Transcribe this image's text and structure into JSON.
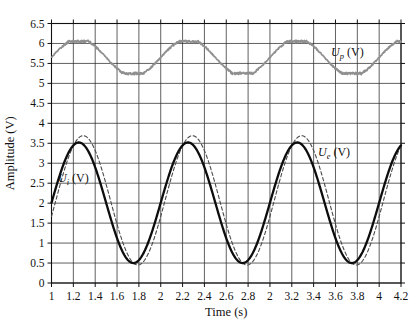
{
  "figure": {
    "background": "#ffffff"
  },
  "chart_data": {
    "type": "line",
    "title": "",
    "xlabel": "Time (s)",
    "ylabel": "Amplitude (V)",
    "xlim": [
      1,
      4.2
    ],
    "ylim": [
      0,
      6.5
    ],
    "grid": true,
    "legend_position": "inline-annotations",
    "x_ticks": [
      {
        "value": 1.0,
        "label": "1"
      },
      {
        "value": 1.2,
        "label": "1.2"
      },
      {
        "value": 1.4,
        "label": "1.4"
      },
      {
        "value": 1.6,
        "label": "1.6"
      },
      {
        "value": 1.8,
        "label": "1.8"
      },
      {
        "value": 2.0,
        "label": "2"
      },
      {
        "value": 2.2,
        "label": "2.2"
      },
      {
        "value": 2.4,
        "label": "2.4"
      },
      {
        "value": 2.6,
        "label": "2.6"
      },
      {
        "value": 2.8,
        "label": "2.8"
      },
      {
        "value": 3.0,
        "label": "2"
      },
      {
        "value": 3.2,
        "label": "3.2"
      },
      {
        "value": 3.4,
        "label": "3.4"
      },
      {
        "value": 3.6,
        "label": "3.6"
      },
      {
        "value": 3.8,
        "label": "3.8"
      },
      {
        "value": 4.0,
        "label": "4"
      },
      {
        "value": 4.2,
        "label": "4.2"
      }
    ],
    "y_ticks": [
      {
        "value": 0,
        "label": "0"
      },
      {
        "value": 0.5,
        "label": "0.5"
      },
      {
        "value": 1,
        "label": "1"
      },
      {
        "value": 1.5,
        "label": "1.5"
      },
      {
        "value": 2,
        "label": "2"
      },
      {
        "value": 2.5,
        "label": "2.5"
      },
      {
        "value": 3,
        "label": "3"
      },
      {
        "value": 3.5,
        "label": "3.5"
      },
      {
        "value": 4,
        "label": "4"
      },
      {
        "value": 4.5,
        "label": "4.5"
      },
      {
        "value": 5,
        "label": "5"
      },
      {
        "value": 5.5,
        "label": "5.5"
      },
      {
        "value": 6,
        "label": "6"
      },
      {
        "value": 6.5,
        "label": "6.5"
      }
    ],
    "series": [
      {
        "name": "Up",
        "label": "Up (V)",
        "waveform": "clipped-sine-with-noise",
        "style": "noisy",
        "color": "#8f8f8f",
        "line_width": 1.7,
        "mean": 5.65,
        "amplitude": 0.4,
        "min": 5.25,
        "max": 6.05,
        "period": 1.0,
        "rising_zero_t": 1.0,
        "clip_gain": 1.18,
        "noise": 0.03,
        "peaks_t": [
          1.25,
          2.25,
          3.25
        ],
        "troughs_t": [
          1.75,
          2.75,
          3.75
        ]
      },
      {
        "name": "Ue",
        "label": "Ue (V)",
        "waveform": "sine",
        "style": "dashed",
        "dash": [
          3.5,
          2.5
        ],
        "color": "#4a4a4a",
        "line_width": 1.1,
        "mean": 2.07,
        "amplitude": 1.62,
        "min": 0.45,
        "max": 3.7,
        "period": 1.0,
        "rising_zero_t": 1.04,
        "peaks_t": [
          1.29,
          2.29,
          3.29
        ],
        "troughs_t": [
          1.79,
          2.79,
          3.79
        ]
      },
      {
        "name": "Ui",
        "label": "Ui (V)",
        "waveform": "sine",
        "style": "solid",
        "color": "#0d0d0d",
        "line_width": 2.3,
        "mean": 2.01,
        "amplitude": 1.51,
        "min": 0.5,
        "max": 3.52,
        "period": 1.0,
        "rising_zero_t": 1.0,
        "peaks_t": [
          1.25,
          2.25,
          3.25
        ],
        "troughs_t": [
          1.75,
          2.75,
          3.75
        ]
      }
    ],
    "annotations": [
      {
        "pre": "U",
        "sub": "p",
        "post": " (V)",
        "x": 3.56,
        "y": 5.79
      },
      {
        "pre": "U",
        "sub": "e",
        "post": " (V)",
        "x": 3.44,
        "y": 3.28
      },
      {
        "pre": "U",
        "sub": "i",
        "post": " (V)",
        "x": 1.06,
        "y": 2.62
      }
    ],
    "colors": {
      "grid": "#2b2b2b",
      "frame": "#111111",
      "tick": "#111111",
      "text": "#111111"
    }
  }
}
